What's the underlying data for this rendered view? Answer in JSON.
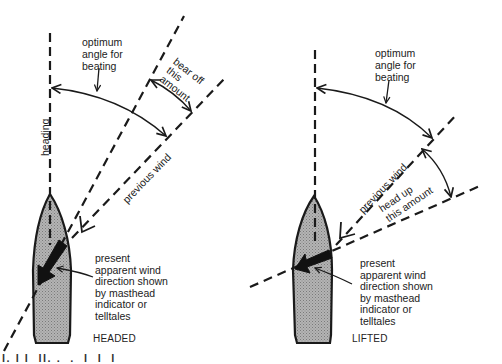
{
  "figure": {
    "left_panel": {
      "caption": "HEADED",
      "optimum_label": "optimum\nangle for\nbeating",
      "heading_label": "heading",
      "previous_wind_label": "previous wind",
      "adjust_label": "bear off\nthis\namount",
      "present_label": "present\napparent wind\ndirection shown\nby masthead\nindicator or\ntelltales"
    },
    "right_panel": {
      "caption": "LIFTED",
      "optimum_label": "optimum\nangle for\nbeating",
      "previous_wind_label": "previous wind",
      "adjust_label": "head up\nthis amount",
      "present_label": "present\napparent wind\ndirection shown\nby masthead\nindicator or\ntelltales"
    },
    "cropped_bottom_text": "l. l l  ll. .  .  l  l  l"
  },
  "colors": {
    "line": "#1a1a1a",
    "hull_fill": "#a9a9a9",
    "background": "#ffffff"
  }
}
